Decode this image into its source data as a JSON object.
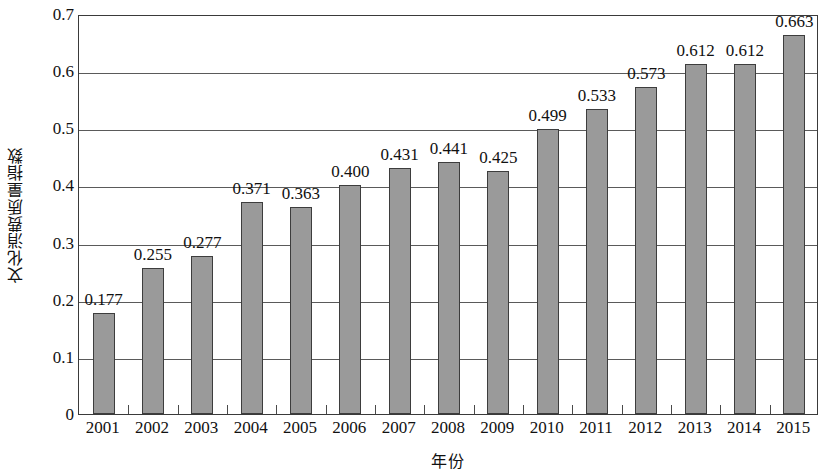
{
  "chart_data": {
    "type": "bar",
    "title": "",
    "xlabel": "年份",
    "ylabel": "文化消费质量指数",
    "categories": [
      "2001",
      "2002",
      "2003",
      "2004",
      "2005",
      "2006",
      "2007",
      "2008",
      "2009",
      "2010",
      "2011",
      "2012",
      "2013",
      "2014",
      "2015"
    ],
    "values": [
      0.177,
      0.255,
      0.277,
      0.371,
      0.363,
      0.4,
      0.431,
      0.441,
      0.425,
      0.499,
      0.533,
      0.573,
      0.612,
      0.612,
      0.663
    ],
    "value_labels": [
      "0.177",
      "0.255",
      "0.277",
      "0.371",
      "0.363",
      "0.400",
      "0.431",
      "0.441",
      "0.425",
      "0.499",
      "0.533",
      "0.573",
      "0.612",
      "0.612",
      "0.663"
    ],
    "ylim": [
      0,
      0.7
    ],
    "ytick_labels": [
      "0",
      "0.1",
      "0.2",
      "0.3",
      "0.4",
      "0.5",
      "0.6",
      "0.7"
    ],
    "ytick_values": [
      0,
      0.1,
      0.2,
      0.3,
      0.4,
      0.5,
      0.6,
      0.7
    ],
    "grid": true,
    "legend": "none",
    "series_name": "文化消费质量指数",
    "bar_color": "#9a9a9a",
    "bar_border_color": "#3d3d3d",
    "axis_color": "#3a3a3a",
    "gridline_color": "#5a5a5a",
    "text_color": "#111111"
  }
}
